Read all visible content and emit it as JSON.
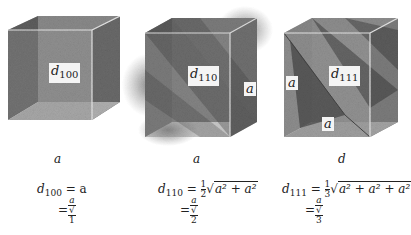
{
  "figure": {
    "panels": [
      {
        "id": "100",
        "plane_label": "d",
        "plane_index": "100",
        "edge_labels": [],
        "caption": "a",
        "equation": {
          "lhs_d": "d",
          "lhs_index": "100",
          "line1_rhs": "= a",
          "line2_prefix": "=",
          "numerator": "a",
          "denominator_root": "1"
        }
      },
      {
        "id": "110",
        "plane_label": "d",
        "plane_index": "110",
        "edge_labels": [
          "a"
        ],
        "caption": "a",
        "equation": {
          "lhs_d": "d",
          "lhs_index": "110",
          "coef_num": "1",
          "coef_den": "2",
          "radicand": "a² + a²",
          "line2_prefix": "=",
          "numerator": "a",
          "denominator_root": "2"
        }
      },
      {
        "id": "111",
        "plane_label": "d",
        "plane_index": "111",
        "edge_labels": [
          "a",
          "a"
        ],
        "caption": "d",
        "equation": {
          "lhs_d": "d",
          "lhs_index": "111",
          "coef_num": "1",
          "coef_den": "3",
          "radicand": "a² + a² + a²",
          "line2_prefix": "=",
          "numerator": "a",
          "denominator_root": "3"
        }
      }
    ]
  }
}
